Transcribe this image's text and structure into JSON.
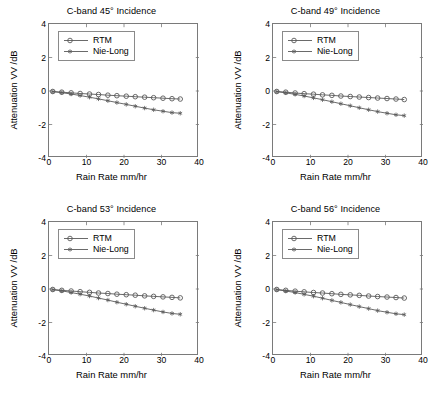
{
  "figure": {
    "background": "#ffffff",
    "panel_count": 4,
    "line_color": "#595959",
    "axis_color": "#7a7a7a"
  },
  "common": {
    "xlabel": "Rain Rate mm/hr",
    "ylabel": "Attenuation VV /dB",
    "xticks": [
      "0",
      "10",
      "20",
      "30",
      "40"
    ],
    "yticks": [
      "4",
      "2",
      "0",
      "-2",
      "-4"
    ],
    "legend": [
      {
        "label": "RTM",
        "marker": "circle-marker"
      },
      {
        "label": "Nie-Long",
        "marker": "asterisk-marker"
      }
    ]
  },
  "panels": [
    {
      "id": "panel-45",
      "title": "C-band 45° Incidence"
    },
    {
      "id": "panel-49",
      "title": "C-band 49° Incidence"
    },
    {
      "id": "panel-53",
      "title": "C-band 53° Incidence"
    },
    {
      "id": "panel-56",
      "title": "C-band 56° Incidence"
    }
  ],
  "chart_data": [
    {
      "type": "line",
      "title": "C-band 45° Incidence",
      "xlabel": "Rain Rate mm/hr",
      "ylabel": "Attenuation VV /dB",
      "xlim": [
        0,
        40
      ],
      "ylim": [
        -4,
        4
      ],
      "xticks": [
        0,
        10,
        20,
        30,
        40
      ],
      "yticks": [
        -4,
        -2,
        0,
        2,
        4
      ],
      "grid": false,
      "legend_position": "upper-left",
      "x": [
        1.0,
        3.4,
        5.9,
        8.3,
        10.8,
        13.2,
        15.7,
        18.1,
        20.6,
        23.0,
        25.5,
        27.9,
        30.4,
        32.8,
        35.0
      ],
      "series": [
        {
          "name": "RTM",
          "marker": "circle-marker",
          "values": [
            -0.03,
            -0.07,
            -0.11,
            -0.15,
            -0.18,
            -0.21,
            -0.25,
            -0.28,
            -0.31,
            -0.34,
            -0.37,
            -0.4,
            -0.43,
            -0.46,
            -0.48
          ]
        },
        {
          "name": "Nie-Long",
          "marker": "asterisk-marker",
          "values": [
            -0.04,
            -0.1,
            -0.18,
            -0.27,
            -0.37,
            -0.47,
            -0.58,
            -0.69,
            -0.8,
            -0.91,
            -1.02,
            -1.12,
            -1.21,
            -1.29,
            -1.33
          ]
        }
      ]
    },
    {
      "type": "line",
      "title": "C-band 49° Incidence",
      "xlabel": "Rain Rate mm/hr",
      "ylabel": "Attenuation VV /dB",
      "xlim": [
        0,
        40
      ],
      "ylim": [
        -4,
        4
      ],
      "xticks": [
        0,
        10,
        20,
        30,
        40
      ],
      "yticks": [
        -4,
        -2,
        0,
        2,
        4
      ],
      "grid": false,
      "legend_position": "upper-left",
      "x": [
        1.0,
        3.4,
        5.9,
        8.3,
        10.8,
        13.2,
        15.7,
        18.1,
        20.6,
        23.0,
        25.5,
        27.9,
        30.4,
        32.8,
        35.0
      ],
      "series": [
        {
          "name": "RTM",
          "marker": "circle-marker",
          "values": [
            -0.03,
            -0.07,
            -0.12,
            -0.16,
            -0.19,
            -0.23,
            -0.26,
            -0.3,
            -0.33,
            -0.36,
            -0.39,
            -0.42,
            -0.45,
            -0.48,
            -0.51
          ]
        },
        {
          "name": "Nie-Long",
          "marker": "asterisk-marker",
          "values": [
            -0.04,
            -0.11,
            -0.2,
            -0.3,
            -0.41,
            -0.52,
            -0.64,
            -0.76,
            -0.88,
            -1.0,
            -1.12,
            -1.23,
            -1.33,
            -1.42,
            -1.47
          ]
        }
      ]
    },
    {
      "type": "line",
      "title": "C-band 53° Incidence",
      "xlabel": "Rain Rate mm/hr",
      "ylabel": "Attenuation VV /dB",
      "xlim": [
        0,
        40
      ],
      "ylim": [
        -4,
        4
      ],
      "xticks": [
        0,
        10,
        20,
        30,
        40
      ],
      "yticks": [
        -4,
        -2,
        0,
        2,
        4
      ],
      "grid": false,
      "legend_position": "upper-left",
      "x": [
        1.0,
        3.4,
        5.9,
        8.3,
        10.8,
        13.2,
        15.7,
        18.1,
        20.6,
        23.0,
        25.5,
        27.9,
        30.4,
        32.8,
        35.0
      ],
      "series": [
        {
          "name": "RTM",
          "marker": "circle-marker",
          "values": [
            -0.03,
            -0.08,
            -0.12,
            -0.16,
            -0.2,
            -0.24,
            -0.27,
            -0.31,
            -0.34,
            -0.37,
            -0.41,
            -0.44,
            -0.47,
            -0.5,
            -0.53
          ]
        },
        {
          "name": "Nie-Long",
          "marker": "asterisk-marker",
          "values": [
            -0.04,
            -0.11,
            -0.21,
            -0.31,
            -0.42,
            -0.54,
            -0.66,
            -0.79,
            -0.91,
            -1.03,
            -1.15,
            -1.26,
            -1.37,
            -1.46,
            -1.51
          ]
        }
      ]
    },
    {
      "type": "line",
      "title": "C-band 56° Incidence",
      "xlabel": "Rain Rate mm/hr",
      "ylabel": "Attenuation VV /dB",
      "xlim": [
        0,
        40
      ],
      "ylim": [
        -4,
        4
      ],
      "xticks": [
        0,
        10,
        20,
        30,
        40
      ],
      "yticks": [
        -4,
        -2,
        0,
        2,
        4
      ],
      "grid": false,
      "legend_position": "upper-left",
      "x": [
        1.0,
        3.4,
        5.9,
        8.3,
        10.8,
        13.2,
        15.7,
        18.1,
        20.6,
        23.0,
        25.5,
        27.9,
        30.4,
        32.8,
        35.0
      ],
      "series": [
        {
          "name": "RTM",
          "marker": "circle-marker",
          "values": [
            -0.03,
            -0.08,
            -0.13,
            -0.17,
            -0.21,
            -0.24,
            -0.28,
            -0.32,
            -0.35,
            -0.38,
            -0.42,
            -0.45,
            -0.48,
            -0.51,
            -0.54
          ]
        },
        {
          "name": "Nie-Long",
          "marker": "asterisk-marker",
          "values": [
            -0.04,
            -0.12,
            -0.21,
            -0.32,
            -0.43,
            -0.55,
            -0.68,
            -0.8,
            -0.93,
            -1.05,
            -1.17,
            -1.29,
            -1.39,
            -1.48,
            -1.53
          ]
        }
      ]
    }
  ]
}
